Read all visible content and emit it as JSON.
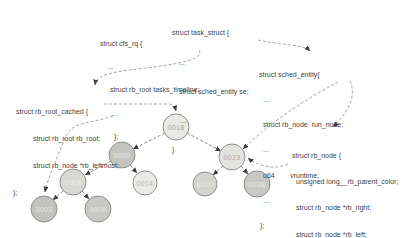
{
  "figure": {
    "background": "#ffffff"
  },
  "colors": {
    "code_text": "#3f3f3f",
    "tree_edge": "#8a8a8a",
    "pointer_arrow": "#9c9c9c",
    "arrowhead": "#3f3f3f",
    "node_stroke": "#91918b"
  },
  "blocks": {
    "cfs_rq": {
      "lines": [
        "struct cfs_rq {",
        "...",
        "struct rb_root tasks_timeline;",
        "...",
        "};"
      ]
    },
    "task_struct": {
      "lines": [
        "struct task_struct {",
        "...",
        "struct sched_entity se;",
        "...",
        "}"
      ]
    },
    "sched_entity": {
      "lines": [
        "struct sched_entity{",
        "...",
        "struct rb_node  run_node;",
        "...",
        "u64        vruntime;",
        "...",
        "};"
      ]
    },
    "rb_root_cached": {
      "lines": [
        "struct rb_root_cached {",
        "struct rb_root rb_root;",
        "struct rb_node *rb_leftmost;",
        "};"
      ]
    },
    "rb_node": {
      "lines": [
        "struct rb_node {",
        "unsigned long__rb_parent_color;",
        "struct rb_node *rb_right;",
        "struct rb_node *rb_left;",
        "};"
      ]
    }
  },
  "tree": {
    "nodes": [
      {
        "label": "0018",
        "fill": "#e9e9e6",
        "text_color": "#a6a6a0"
      },
      {
        "label": "0009",
        "fill": "#c4c4c1",
        "text_color": "#e8e8e4"
      },
      {
        "label": "0023",
        "fill": "#e3e3e0",
        "text_color": "#adada7"
      },
      {
        "label": "0004",
        "fill": "#d8d8d5",
        "text_color": "#efefeb"
      },
      {
        "label": "0014",
        "fill": "#ebebe8",
        "text_color": "#b3b3ad"
      },
      {
        "label": "0020",
        "fill": "#d4d4d1",
        "text_color": "#ebebe7"
      },
      {
        "label": "0028",
        "fill": "#c8c8c5",
        "text_color": "#e8e8e4"
      },
      {
        "label": "0003",
        "fill": "#c2c2bf",
        "text_color": "#e6e6e2"
      },
      {
        "label": "0006",
        "fill": "#c8c8c5",
        "text_color": "#e6e6e2"
      }
    ]
  }
}
